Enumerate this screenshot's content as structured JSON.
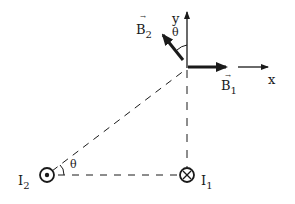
{
  "diagram": {
    "type": "physics-magnetic-field",
    "labels": {
      "y_axis": "y",
      "x_axis": "x",
      "theta_top": "θ",
      "theta_bottom": "θ",
      "b1": "B",
      "b1_sub": "1",
      "b2": "B",
      "b2_sub": "2",
      "i1": "I",
      "i1_sub": "1",
      "i2": "I",
      "i2_sub": "2",
      "vec_arrow": "→"
    },
    "elements": {
      "i1_symbol": "cross-into-page",
      "i2_symbol": "dot-out-of-page"
    },
    "colors": {
      "ink": "#1a1a1a",
      "background": "#ffffff"
    }
  }
}
